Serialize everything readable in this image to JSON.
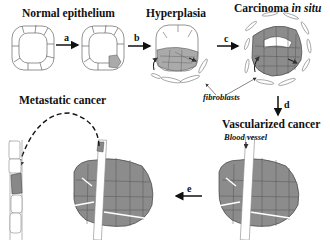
{
  "stages": {
    "normal": {
      "label": "Normal epithelium"
    },
    "hyperplasia": {
      "label": "Hyperplasia"
    },
    "carcinoma": {
      "label": "Carcinoma ",
      "label_italic": "in situ"
    },
    "vascularized": {
      "label": "Vascularized cancer"
    },
    "metastatic": {
      "label": "Metastatic cancer"
    }
  },
  "steps": {
    "a": "a",
    "b": "b",
    "c": "c",
    "d": "d",
    "e": "e"
  },
  "annotations": {
    "fibroblasts": "fibroblasts",
    "blood_vessel": "Blood vessel"
  },
  "colors": {
    "cell_fill": "#8c8c8c",
    "cell_light": "#b0b0b0",
    "outline": "#555555",
    "arrow": "#111111"
  }
}
